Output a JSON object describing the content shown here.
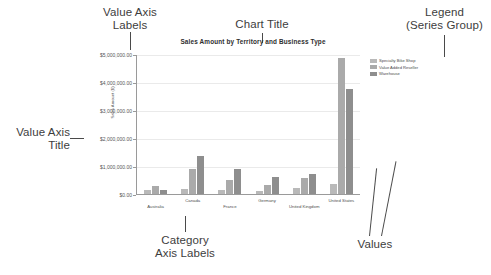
{
  "annotations": {
    "value_axis_labels": "Value Axis\nLabels",
    "chart_title": "Chart Title",
    "legend": "Legend\n(Series Group)",
    "value_axis_title": "Value Axis\nTitle",
    "category_axis_labels": "Category\nAxis Labels",
    "values": "Values"
  },
  "chart_data": {
    "type": "bar",
    "title": "Sales Amount by Territory and Business Type",
    "xlabel": "",
    "ylabel": "Sales Amount ($)",
    "categories": [
      "Australia",
      "Canada",
      "France",
      "Germany",
      "United Kingdom",
      "United States"
    ],
    "series": [
      {
        "name": "Specialty Bike Shop",
        "color": "#b9b9b9",
        "values": [
          150000,
          180000,
          160000,
          120000,
          210000,
          350000
        ]
      },
      {
        "name": "Value Added Reseller",
        "color": "#aaaaaa",
        "values": [
          270000,
          900000,
          500000,
          330000,
          560000,
          4850000
        ]
      },
      {
        "name": "Warehouse",
        "color": "#8e8e8e",
        "values": [
          140000,
          1350000,
          880000,
          620000,
          700000,
          3750000
        ]
      }
    ],
    "ylim": [
      0,
      5000000
    ],
    "ytick_labels": [
      "$5,000,000.00",
      "$4,000,000.00",
      "$3,000,000.00",
      "$2,000,000.00",
      "$1,000,000.00",
      "$0.00"
    ],
    "ytick_values": [
      5000000,
      4000000,
      3000000,
      2000000,
      1000000,
      0
    ],
    "grid": true,
    "legend_position": "right"
  }
}
